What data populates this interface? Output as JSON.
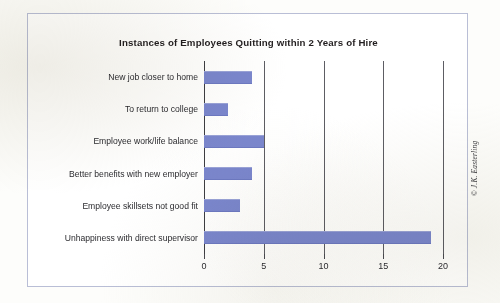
{
  "credit": "© J.K. Easterling",
  "colors": {
    "bar": "#7b87ce",
    "frame": "#b9bed6",
    "gridline": "#5d5d63",
    "axis": "#3d3d42",
    "text": "#2c2c30",
    "page_background": "#fdfdfb",
    "plot_background": "#ffffff"
  },
  "chart_data": {
    "type": "bar",
    "orientation": "horizontal",
    "title": "Instances of Employees Quitting within 2 Years of Hire",
    "xlabel": "",
    "ylabel": "",
    "categories": [
      "New job closer to home",
      "To return to college",
      "Employee work/life balance",
      "Better benefits with new employer",
      "Employee skillsets not good fit",
      "Unhappiness with direct supervisor"
    ],
    "values": [
      4,
      2,
      5,
      4,
      3,
      19
    ],
    "xlim": [
      0,
      20
    ],
    "xticks": [
      0,
      5,
      10,
      15,
      20
    ],
    "xtick_labels": [
      "0",
      "5",
      "10",
      "15",
      "20"
    ],
    "grid": "vertical",
    "legend": "none"
  }
}
